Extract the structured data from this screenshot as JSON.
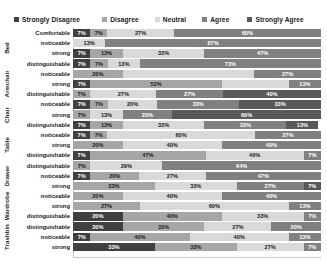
{
  "chart_data": {
    "type": "bar",
    "subtype": "stacked-horizontal-100",
    "title": "",
    "xlabel": "",
    "ylabel": "",
    "xlim": [
      0,
      100
    ],
    "grid": false,
    "legend_position": "top",
    "legend": [
      "Strongly Disagree",
      "Disagree",
      "Neutral",
      "Agree",
      "Strongly Agree"
    ],
    "colors": [
      "#404040",
      "#a6a6a6",
      "#d9d9d9",
      "#808080",
      "#595959"
    ],
    "groups": [
      "Bed",
      "Armchair",
      "Chair",
      "Table",
      "Drawer",
      "Wardrobe",
      "Trashbin"
    ],
    "categories": [
      "Comfortable",
      "noticeable",
      "strong",
      "distinguishable",
      "noticeable",
      "strong",
      "distinguishable",
      "noticeable",
      "strong",
      "distinguishable",
      "noticeable",
      "strong",
      "distinguishable",
      "noticeable",
      "strong",
      "distinguishable",
      "noticeable",
      "strong",
      "distinguishable",
      "noticeable",
      "strong",
      "distinguishable"
    ],
    "series": [
      {
        "name": "Strongly Disagree",
        "values": [
          7,
          0,
          7,
          7,
          0,
          7,
          0,
          7,
          0,
          7,
          7,
          0,
          7,
          0,
          7,
          0,
          0,
          0,
          20,
          20,
          7,
          33
        ]
      },
      {
        "name": "Disagree",
        "values": [
          7,
          0,
          13,
          7,
          20,
          53,
          7,
          7,
          7,
          13,
          7,
          20,
          47,
          7,
          20,
          33,
          20,
          27,
          40,
          33,
          40,
          33
        ]
      },
      {
        "name": "Neutral",
        "values": [
          27,
          13,
          33,
          13,
          53,
          27,
          27,
          20,
          13,
          33,
          60,
          40,
          40,
          29,
          27,
          33,
          40,
          60,
          33,
          27,
          40,
          27
        ]
      },
      {
        "name": "Agree",
        "values": [
          60,
          87,
          47,
          73,
          27,
          13,
          40,
          33,
          20,
          33,
          27,
          40,
          7,
          64,
          47,
          27,
          40,
          13,
          7,
          20,
          13,
          7
        ]
      },
      {
        "name": "Strongly Agree",
        "values": [
          0,
          0,
          0,
          0,
          0,
          0,
          27,
          33,
          60,
          13,
          0,
          0,
          0,
          0,
          0,
          7,
          0,
          0,
          0,
          0,
          0,
          0
        ]
      }
    ],
    "rows": [
      {
        "group": "Bed",
        "label": "Comfortable",
        "segments": [
          {
            "series": "Strongly Disagree",
            "value": 7,
            "label": "7%"
          },
          {
            "series": "Disagree",
            "value": 7,
            "label": "7%"
          },
          {
            "series": "Neutral",
            "value": 27,
            "label": "27%"
          },
          {
            "series": "Agree",
            "value": 60,
            "label": "60%"
          }
        ]
      },
      {
        "group": "Bed",
        "label": "noticeable",
        "segments": [
          {
            "series": "Neutral",
            "value": 13,
            "label": "13%"
          },
          {
            "series": "Agree",
            "value": 87,
            "label": "87%"
          }
        ]
      },
      {
        "group": "Bed",
        "label": "strong",
        "segments": [
          {
            "series": "Strongly Disagree",
            "value": 7,
            "label": "7%"
          },
          {
            "series": "Disagree",
            "value": 13,
            "label": "13%"
          },
          {
            "series": "Neutral",
            "value": 33,
            "label": "33%"
          },
          {
            "series": "Agree",
            "value": 47,
            "label": "47%"
          }
        ]
      },
      {
        "group": "Bed",
        "label": "distinguishable",
        "segments": [
          {
            "series": "Strongly Disagree",
            "value": 7,
            "label": "7%"
          },
          {
            "series": "Disagree",
            "value": 7,
            "label": "7%"
          },
          {
            "series": "Neutral",
            "value": 13,
            "label": "13%"
          },
          {
            "series": "Agree",
            "value": 73,
            "label": "73%"
          }
        ]
      },
      {
        "group": "Armchair",
        "label": "noticeable",
        "segments": [
          {
            "series": "Disagree",
            "value": 20,
            "label": "20%"
          },
          {
            "series": "Neutral",
            "value": 53,
            "label": ""
          },
          {
            "series": "Agree",
            "value": 27,
            "label": "27%"
          }
        ]
      },
      {
        "group": "Armchair",
        "label": "strong",
        "segments": [
          {
            "series": "Strongly Disagree",
            "value": 7,
            "label": "7%"
          },
          {
            "series": "Disagree",
            "value": 53,
            "label": "53%"
          },
          {
            "series": "Neutral",
            "value": 27,
            "label": ""
          },
          {
            "series": "Agree",
            "value": 13,
            "label": "13%"
          }
        ]
      },
      {
        "group": "Armchair",
        "label": "distinguishable",
        "segments": [
          {
            "series": "Disagree",
            "value": 7,
            "label": "7%"
          },
          {
            "series": "Neutral",
            "value": 27,
            "label": "27%"
          },
          {
            "series": "Agree",
            "value": 27,
            "label": "27%"
          },
          {
            "series": "Strongly Agree",
            "value": 40,
            "label": "40%"
          }
        ]
      },
      {
        "group": "Chair",
        "label": "noticeable",
        "segments": [
          {
            "series": "Strongly Disagree",
            "value": 7,
            "label": "7%"
          },
          {
            "series": "Disagree",
            "value": 7,
            "label": "7%"
          },
          {
            "series": "Neutral",
            "value": 20,
            "label": "20%"
          },
          {
            "series": "Agree",
            "value": 33,
            "label": "33%"
          },
          {
            "series": "Strongly Agree",
            "value": 33,
            "label": "33%"
          }
        ]
      },
      {
        "group": "Chair",
        "label": "strong",
        "segments": [
          {
            "series": "Disagree",
            "value": 7,
            "label": "7%"
          },
          {
            "series": "Neutral",
            "value": 13,
            "label": "13%"
          },
          {
            "series": "Agree",
            "value": 20,
            "label": "20%"
          },
          {
            "series": "Strongly Agree",
            "value": 60,
            "label": "60%"
          }
        ]
      },
      {
        "group": "Chair",
        "label": "distinguishable",
        "segments": [
          {
            "series": "Strongly Disagree",
            "value": 7,
            "label": "7%"
          },
          {
            "series": "Disagree",
            "value": 13,
            "label": "13%"
          },
          {
            "series": "Neutral",
            "value": 33,
            "label": "33%"
          },
          {
            "series": "Agree",
            "value": 33,
            "label": "33%"
          },
          {
            "series": "Strongly Agree",
            "value": 13,
            "label": "13%"
          }
        ]
      },
      {
        "group": "Table",
        "label": "noticeable",
        "segments": [
          {
            "series": "Strongly Disagree",
            "value": 7,
            "label": "7%"
          },
          {
            "series": "Disagree",
            "value": 7,
            "label": "7%"
          },
          {
            "series": "Neutral",
            "value": 60,
            "label": "60%"
          },
          {
            "series": "Agree",
            "value": 27,
            "label": "27%"
          }
        ]
      },
      {
        "group": "Table",
        "label": "strong",
        "segments": [
          {
            "series": "Disagree",
            "value": 20,
            "label": "20%"
          },
          {
            "series": "Neutral",
            "value": 40,
            "label": "40%"
          },
          {
            "series": "Agree",
            "value": 40,
            "label": "40%"
          }
        ]
      },
      {
        "group": "Table",
        "label": "distinguishable",
        "segments": [
          {
            "series": "Strongly Disagree",
            "value": 7,
            "label": "7%"
          },
          {
            "series": "Disagree",
            "value": 47,
            "label": "47%"
          },
          {
            "series": "Neutral",
            "value": 40,
            "label": "40%"
          },
          {
            "series": "Agree",
            "value": 7,
            "label": "7%"
          }
        ]
      },
      {
        "group": "Drawer",
        "label": "distinguishable",
        "segments": [
          {
            "series": "Disagree",
            "value": 7,
            "label": "7%"
          },
          {
            "series": "Neutral",
            "value": 29,
            "label": "29%"
          },
          {
            "series": "Agree",
            "value": 64,
            "label": "64%"
          }
        ]
      },
      {
        "group": "Drawer",
        "label": "noticeable",
        "segments": [
          {
            "series": "Strongly Disagree",
            "value": 7,
            "label": "7%"
          },
          {
            "series": "Disagree",
            "value": 20,
            "label": "20%"
          },
          {
            "series": "Neutral",
            "value": 27,
            "label": "27%"
          },
          {
            "series": "Agree",
            "value": 47,
            "label": "47%"
          }
        ]
      },
      {
        "group": "Drawer",
        "label": "strong",
        "segments": [
          {
            "series": "Disagree",
            "value": 33,
            "label": "33%"
          },
          {
            "series": "Neutral",
            "value": 33,
            "label": "33%"
          },
          {
            "series": "Agree",
            "value": 27,
            "label": "27%"
          },
          {
            "series": "Strongly Agree",
            "value": 7,
            "label": "7%"
          }
        ]
      },
      {
        "group": "Wardrobe",
        "label": "noticeable",
        "segments": [
          {
            "series": "Disagree",
            "value": 20,
            "label": "20%"
          },
          {
            "series": "Neutral",
            "value": 40,
            "label": "40%"
          },
          {
            "series": "Agree",
            "value": 40,
            "label": "40%"
          }
        ]
      },
      {
        "group": "Wardrobe",
        "label": "strong",
        "segments": [
          {
            "series": "Disagree",
            "value": 27,
            "label": "27%"
          },
          {
            "series": "Neutral",
            "value": 60,
            "label": "60%"
          },
          {
            "series": "Agree",
            "value": 13,
            "label": "13%"
          }
        ]
      },
      {
        "group": "Wardrobe",
        "label": "distinguishable",
        "segments": [
          {
            "series": "Strongly Disagree",
            "value": 20,
            "label": "20%"
          },
          {
            "series": "Disagree",
            "value": 40,
            "label": "40%"
          },
          {
            "series": "Neutral",
            "value": 33,
            "label": "33%"
          },
          {
            "series": "Agree",
            "value": 7,
            "label": "7%"
          }
        ]
      },
      {
        "group": "Trashbin",
        "label": "distinguishable",
        "segments": [
          {
            "series": "Strongly Disagree",
            "value": 20,
            "label": "20%"
          },
          {
            "series": "Disagree",
            "value": 33,
            "label": "33%"
          },
          {
            "series": "Neutral",
            "value": 27,
            "label": "27%"
          },
          {
            "series": "Agree",
            "value": 20,
            "label": "20%"
          }
        ]
      },
      {
        "group": "Trashbin",
        "label": "noticeable",
        "segments": [
          {
            "series": "Strongly Disagree",
            "value": 7,
            "label": "7%"
          },
          {
            "series": "Disagree",
            "value": 40,
            "label": "40%"
          },
          {
            "series": "Neutral",
            "value": 40,
            "label": "40%"
          },
          {
            "series": "Agree",
            "value": 13,
            "label": "13%"
          }
        ]
      },
      {
        "group": "Trashbin",
        "label": "strong",
        "segments": [
          {
            "series": "Strongly Disagree",
            "value": 33,
            "label": "33%"
          },
          {
            "series": "Disagree",
            "value": 33,
            "label": "33%"
          },
          {
            "series": "Neutral",
            "value": 27,
            "label": "27%"
          },
          {
            "series": "Agree",
            "value": 7,
            "label": "7%"
          }
        ]
      }
    ]
  }
}
